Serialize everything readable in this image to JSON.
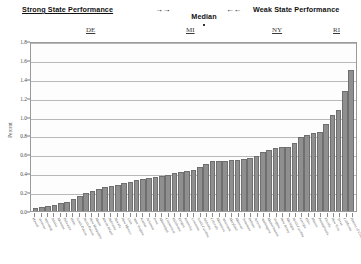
{
  "header": {
    "strong_label": "Strong State Performance",
    "arrows_left": "→→",
    "median_label": "Median",
    "arrows_right": "←←",
    "weak_label": "Weak State Performance"
  },
  "callouts": [
    {
      "label": "DE"
    },
    {
      "label": "MI"
    },
    {
      "label": "NY"
    },
    {
      "label": "RI"
    }
  ],
  "chart_data": {
    "type": "bar",
    "title": "",
    "xlabel": "",
    "ylabel": "Percent",
    "ylim": [
      0.0,
      1.8
    ],
    "ytick_labels": [
      "0.0",
      "0.2",
      "0.4",
      "0.6",
      "0.8",
      "1.0",
      "1.2",
      "1.4",
      "1.6",
      "1.8"
    ],
    "ytick_values": [
      0.0,
      0.2,
      0.4,
      0.6,
      0.8,
      1.0,
      1.2,
      1.4,
      1.6,
      1.8
    ],
    "grid": true,
    "legend": "none",
    "sorted": "ascending",
    "categories": [
      "Hawaii",
      "Vermont",
      "Wyoming",
      "Alaska",
      "Montana",
      "Delaware",
      "Idaho",
      "South Dakota",
      "North Dakota",
      "New Hampshire",
      "Maine",
      "Rhode Island",
      "Nebraska",
      "Nevada",
      "New Mexico",
      "Utah",
      "West Virginia",
      "Kansas",
      "Arkansas",
      "Iowa",
      "Mississippi",
      "Connecticut",
      "Oklahoma",
      "Oregon",
      "Kentucky",
      "Louisiana",
      "South Carolina",
      "Alabama",
      "Colorado",
      "Minnesota",
      "Wisconsin",
      "Maryland",
      "Missouri",
      "Tennessee",
      "Indiana",
      "Arizona",
      "Washington",
      "Massachusetts",
      "Virginia",
      "New Jersey",
      "Michigan",
      "North Carolina",
      "Georgia",
      "Ohio",
      "Illinois",
      "Pennsylvania",
      "Florida",
      "New York",
      "Texas",
      "California",
      "District of Columbia"
    ],
    "values": [
      0.02,
      0.03,
      0.04,
      0.05,
      0.07,
      0.09,
      0.12,
      0.15,
      0.18,
      0.2,
      0.23,
      0.25,
      0.26,
      0.27,
      0.29,
      0.3,
      0.32,
      0.33,
      0.34,
      0.35,
      0.36,
      0.38,
      0.4,
      0.41,
      0.42,
      0.43,
      0.46,
      0.49,
      0.52,
      0.53,
      0.53,
      0.54,
      0.54,
      0.55,
      0.56,
      0.58,
      0.62,
      0.64,
      0.66,
      0.67,
      0.68,
      0.72,
      0.78,
      0.8,
      0.82,
      0.84,
      0.92,
      1.02,
      1.07,
      1.28,
      1.5
    ]
  }
}
